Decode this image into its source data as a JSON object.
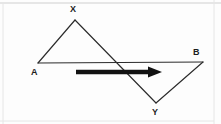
{
  "figure": {
    "width": 221,
    "height": 124,
    "background_color": "#fdfdfd",
    "line_color": "#2b2b2b",
    "arrow_color": "#121212",
    "frame_color": "#cfcfcf",
    "label_color": "#1c1c1c"
  },
  "labels": {
    "a": "A",
    "b": "B",
    "x": "X",
    "y": "Y"
  },
  "label_positions": {
    "a": {
      "left": 31,
      "top": 68
    },
    "b": {
      "left": 193,
      "top": 48
    },
    "x": {
      "left": 70,
      "top": 5
    },
    "y": {
      "left": 152,
      "top": 108
    }
  },
  "vertices": {
    "a": {
      "x": 38,
      "y": 63
    },
    "b": {
      "x": 203,
      "y": 62
    },
    "x": {
      "x": 75,
      "y": 20
    },
    "y": {
      "x": 156,
      "y": 103
    }
  },
  "segments": [
    {
      "name": "segment-a-x",
      "from": "a",
      "to": "x",
      "path": "M 38 63 L 75 20"
    },
    {
      "name": "segment-x-y",
      "from": "x",
      "to": "y",
      "path": "M 75 20 L 156 103"
    },
    {
      "name": "segment-a-b",
      "from": "a",
      "to": "b",
      "path": "M 38 63 L 203 62"
    },
    {
      "name": "segment-y-b",
      "from": "y",
      "to": "b",
      "path": "M 156 103 L 203 62"
    }
  ],
  "arrow": {
    "name": "direction-arrow",
    "shaft_path": "M 76 72 L 150 72",
    "head_points": "148,66.5 162,72 148,77.5",
    "from_x": 76,
    "to_x": 162,
    "y": 72
  },
  "frame": {
    "top_path": "M 0 3 L 221 3",
    "right_path": "M 214 0 L 214 124",
    "left_path": "M 3 3 L 3 124",
    "bottom_path": "M 0 121 L 214 121"
  }
}
